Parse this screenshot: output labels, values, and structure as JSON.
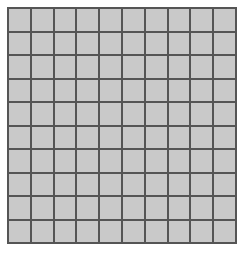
{
  "figure": {
    "name": "square-grid",
    "type": "grid",
    "columns": 10,
    "rows": 10,
    "total_cells": 100,
    "background_color": "#ffffff",
    "cell_fill_color": "#c9c9c9",
    "grid_line_color": "#555555",
    "grid_line_width_px": 2,
    "cell_width_px": 21,
    "cell_height_px": 21.7,
    "grid_left_px": 7,
    "grid_top_px": 7,
    "grid_width_px": 230,
    "grid_height_px": 237,
    "labels": [],
    "annotations": [],
    "title": ""
  }
}
